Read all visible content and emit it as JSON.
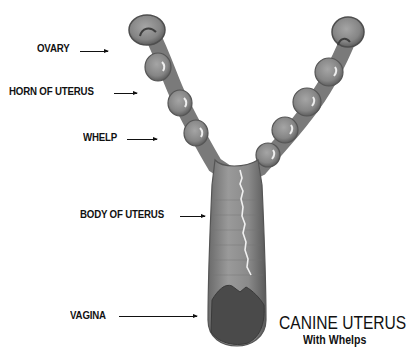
{
  "figure": {
    "title": "CANINE UTERUS",
    "subtitle": "With Whelps"
  },
  "labels": [
    {
      "id": "ovary",
      "text": "OVARY"
    },
    {
      "id": "horn",
      "text": "HORN OF UTERUS"
    },
    {
      "id": "whelp",
      "text": "WHELP"
    },
    {
      "id": "body",
      "text": "BODY OF UTERUS"
    },
    {
      "id": "vagina",
      "text": "VAGINA"
    }
  ],
  "colors": {
    "organ_fill": "#8a8a8a",
    "organ_dark": "#5a5a5a",
    "highlight": "#e8e8e8",
    "text": "#111111",
    "background": "#ffffff"
  }
}
